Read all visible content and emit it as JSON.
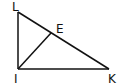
{
  "diagram": {
    "type": "geometry",
    "stroke_color": "#111111",
    "points": {
      "L": {
        "label": "L",
        "x": 18,
        "y": 12
      },
      "I": {
        "label": "I",
        "x": 18,
        "y": 69
      },
      "K": {
        "label": "K",
        "x": 109,
        "y": 69
      },
      "E": {
        "label": "E",
        "x": 51,
        "y": 33
      }
    },
    "segments": [
      [
        "L",
        "I"
      ],
      [
        "I",
        "K"
      ],
      [
        "L",
        "K"
      ],
      [
        "I",
        "E"
      ]
    ]
  }
}
